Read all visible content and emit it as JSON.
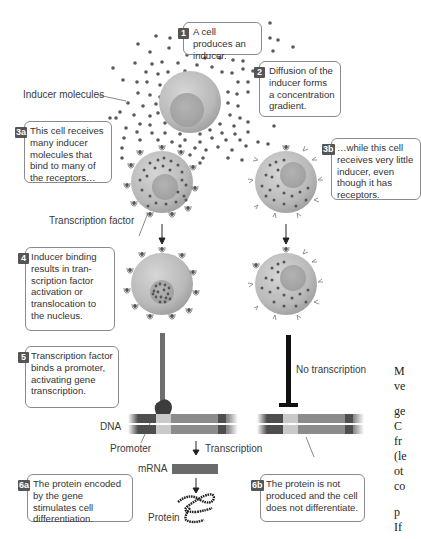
{
  "figure": {
    "steps": [
      {
        "id": "1",
        "badge": "1",
        "text": "A cell produces an inducer."
      },
      {
        "id": "2",
        "badge": "2",
        "text": "Diffusion of the inducer forms a concentration gradient."
      },
      {
        "id": "3a",
        "badge": "3a",
        "text": "This cell receives many inducer molecules that bind to many of the receptors…"
      },
      {
        "id": "3b",
        "badge": "3b",
        "text": "…while this cell receives very little inducer, even though it has receptors."
      },
      {
        "id": "4",
        "badge": "4",
        "text": "Inducer binding results in tran-scription factor activation or translocation to the nucleus."
      },
      {
        "id": "5",
        "badge": "5",
        "text": "Transcription factor binds a promoter, activating gene transcription."
      },
      {
        "id": "6a",
        "badge": "6a",
        "text": "The protein encoded by the gene stimulates cell differentiation."
      },
      {
        "id": "6b",
        "badge": "6b",
        "text": "The protein is not produced and the cell does not differentiate."
      }
    ],
    "labels": {
      "inducer_molecules": "Inducer molecules",
      "transcription_factor": "Transcription factor",
      "no_transcription": "No transcription",
      "dna": "DNA",
      "promoter": "Promoter",
      "transcription": "Transcription",
      "mrna": "mRNA",
      "protein": "Protein"
    },
    "colors": {
      "cell_fill": "#b8b8b8",
      "nucleus_fill": "#a2a2a2",
      "dot": "#555555",
      "dna_dark": "#4e4e4e",
      "dna_mid": "#8c8c8c",
      "promoter": "#c9c9c9",
      "arrow_active": "#6e6e6e",
      "arrow_block": "#111111",
      "badge": "#555555"
    }
  },
  "page_margin_text": [
    "M",
    "ve",
    "",
    "ge",
    "C",
    "fr",
    "(le",
    "ot",
    "co",
    "",
    "p",
    "If"
  ]
}
